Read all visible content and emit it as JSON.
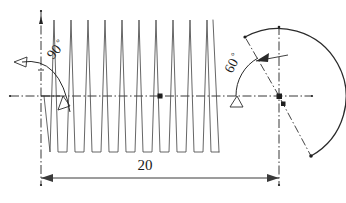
{
  "drawing": {
    "title": "Helical spring / thread profile with angular dimensions",
    "background_color": "#ffffff",
    "line_color": "#3a3a3a",
    "centerline_color": "#222222",
    "text_color": "#1a1a1a"
  },
  "dimensions": {
    "length": {
      "label": "20",
      "name": "overall-length",
      "x_start": 41,
      "x_end": 279,
      "y": 178
    }
  },
  "angles": [
    {
      "label": "90",
      "degree_symbol": "°",
      "name": "left-angle",
      "value": 90,
      "text_x": 53,
      "text_y": 60,
      "rotation": -50
    },
    {
      "label": "60",
      "degree_symbol": "°",
      "name": "right-angle",
      "value": 60,
      "text_x": 232,
      "text_y": 70,
      "rotation": -62
    }
  ],
  "geometry": {
    "horizontal_centerline": {
      "x1": 10,
      "x2": 312,
      "y": 96
    },
    "vertical_axis_left": {
      "x": 41,
      "y1": 10,
      "y2": 186
    },
    "vertical_axis_right": {
      "x": 279,
      "y1": 26,
      "y2": 186
    },
    "wave": {
      "x_start": 44,
      "x_end": 219,
      "cycles": 10,
      "amplitude_top": 20,
      "amplitude_bottom": 152,
      "description": "sawtooth zigzag spring profile"
    },
    "arc": {
      "center_x": 279,
      "center_y": 96,
      "radius": 68,
      "start_angle_deg": 120,
      "end_angle_deg": -62
    },
    "center_marks": [
      {
        "name": "wave-center-mark",
        "x": 160,
        "y": 96
      },
      {
        "name": "arc-center-mark",
        "x": 279,
        "y": 96
      },
      {
        "name": "arc-lower-center-mark",
        "x": 283,
        "y": 104
      }
    ]
  }
}
